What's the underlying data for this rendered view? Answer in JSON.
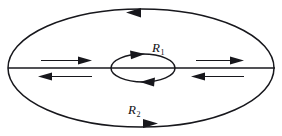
{
  "figure": {
    "type": "vector-diagram",
    "background_color": "#ffffff",
    "stroke_color": "#17171c",
    "width": 282,
    "height": 136
  },
  "labels": {
    "inner_radius": {
      "base": "R",
      "subscript": "1",
      "full": "R1"
    },
    "outer_radius": {
      "base": "R",
      "subscript": "2",
      "full": "R2"
    }
  },
  "shapes": {
    "outer_ellipse": {
      "name": "outer-ellipse",
      "cx": 141,
      "cy": 68,
      "rx": 133,
      "ry": 59
    },
    "inner_ellipse": {
      "name": "inner-ellipse",
      "cx": 143,
      "cy": 68,
      "rx": 32,
      "ry": 14
    },
    "axis": {
      "name": "horizontal-axis",
      "x1": 8,
      "y1": 68,
      "x2": 275,
      "y2": 68
    }
  },
  "arrows": [
    {
      "name": "outer-top-arrow",
      "direction": "left",
      "location": "outer-ellipse-top"
    },
    {
      "name": "outer-bottom-arrow",
      "direction": "right",
      "location": "outer-ellipse-bottom"
    },
    {
      "name": "inner-top-arrow",
      "direction": "right",
      "location": "inner-ellipse-top"
    },
    {
      "name": "inner-bottom-arrow",
      "direction": "left",
      "location": "inner-ellipse-bottom"
    },
    {
      "name": "left-upper-flow-arrow",
      "direction": "right",
      "location": "left-above-axis"
    },
    {
      "name": "left-lower-flow-arrow",
      "direction": "left",
      "location": "left-below-axis"
    },
    {
      "name": "right-upper-flow-arrow",
      "direction": "right",
      "location": "right-above-axis"
    },
    {
      "name": "right-lower-flow-arrow",
      "direction": "left",
      "location": "right-below-axis"
    }
  ]
}
